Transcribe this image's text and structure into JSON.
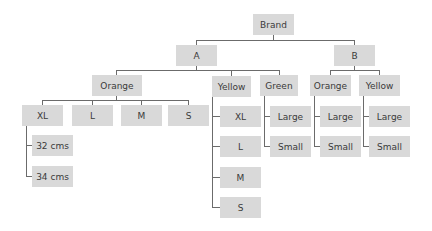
{
  "diagram": {
    "type": "tree",
    "node_fill": "#d9d9d9",
    "line_color": "#6b6b6b",
    "text_color": "#3a3a3a",
    "nodes": [
      {
        "id": "brand",
        "label": "Brand",
        "x": 253,
        "y": 14,
        "w": 41,
        "h": 21
      },
      {
        "id": "a",
        "label": "A",
        "x": 176,
        "y": 45,
        "w": 41,
        "h": 21
      },
      {
        "id": "b",
        "label": "B",
        "x": 334,
        "y": 45,
        "w": 41,
        "h": 21
      },
      {
        "id": "a-orange",
        "label": "Orange",
        "x": 92,
        "y": 75,
        "w": 50,
        "h": 21
      },
      {
        "id": "a-yellow",
        "label": "Yellow",
        "x": 212,
        "y": 76,
        "w": 39,
        "h": 21
      },
      {
        "id": "a-green",
        "label": "Green",
        "x": 260,
        "y": 75,
        "w": 38,
        "h": 21
      },
      {
        "id": "b-orange",
        "label": "Orange",
        "x": 310,
        "y": 75,
        "w": 41,
        "h": 21
      },
      {
        "id": "b-yellow",
        "label": "Yellow",
        "x": 359,
        "y": 75,
        "w": 41,
        "h": 21
      },
      {
        "id": "ao-xl",
        "label": "XL",
        "x": 22,
        "y": 105,
        "w": 41,
        "h": 21
      },
      {
        "id": "ao-l",
        "label": "L",
        "x": 72,
        "y": 105,
        "w": 41,
        "h": 21
      },
      {
        "id": "ao-m",
        "label": "M",
        "x": 121,
        "y": 105,
        "w": 41,
        "h": 21
      },
      {
        "id": "ao-s",
        "label": "S",
        "x": 168,
        "y": 105,
        "w": 41,
        "h": 21
      },
      {
        "id": "xl-32",
        "label": "32 cms",
        "x": 32,
        "y": 135,
        "w": 41,
        "h": 21
      },
      {
        "id": "xl-34",
        "label": "34 cms",
        "x": 32,
        "y": 166,
        "w": 41,
        "h": 21
      },
      {
        "id": "ay-xl",
        "label": "XL",
        "x": 220,
        "y": 106,
        "w": 41,
        "h": 21
      },
      {
        "id": "ay-l",
        "label": "L",
        "x": 220,
        "y": 136,
        "w": 41,
        "h": 21
      },
      {
        "id": "ay-m",
        "label": "M",
        "x": 220,
        "y": 167,
        "w": 41,
        "h": 21
      },
      {
        "id": "ay-s",
        "label": "S",
        "x": 220,
        "y": 197,
        "w": 41,
        "h": 21
      },
      {
        "id": "ag-large",
        "label": "Large",
        "x": 270,
        "y": 106,
        "w": 41,
        "h": 21
      },
      {
        "id": "ag-small",
        "label": "Small",
        "x": 270,
        "y": 136,
        "w": 41,
        "h": 21
      },
      {
        "id": "bo-large",
        "label": "Large",
        "x": 320,
        "y": 106,
        "w": 41,
        "h": 21
      },
      {
        "id": "bo-small",
        "label": "Small",
        "x": 320,
        "y": 136,
        "w": 41,
        "h": 21
      },
      {
        "id": "by-large",
        "label": "Large",
        "x": 369,
        "y": 106,
        "w": 41,
        "h": 21
      },
      {
        "id": "by-small",
        "label": "Small",
        "x": 369,
        "y": 136,
        "w": 41,
        "h": 21
      }
    ],
    "lines": [
      {
        "x": 273,
        "y": 35,
        "w": 1,
        "h": 5
      },
      {
        "x": 196,
        "y": 40,
        "w": 159,
        "h": 1
      },
      {
        "x": 196,
        "y": 40,
        "w": 1,
        "h": 5
      },
      {
        "x": 354,
        "y": 40,
        "w": 1,
        "h": 5
      },
      {
        "x": 196,
        "y": 66,
        "w": 1,
        "h": 4
      },
      {
        "x": 116,
        "y": 70,
        "w": 164,
        "h": 1
      },
      {
        "x": 116,
        "y": 70,
        "w": 1,
        "h": 5
      },
      {
        "x": 231,
        "y": 70,
        "w": 1,
        "h": 6
      },
      {
        "x": 279,
        "y": 70,
        "w": 1,
        "h": 5
      },
      {
        "x": 354,
        "y": 66,
        "w": 1,
        "h": 4
      },
      {
        "x": 330,
        "y": 70,
        "w": 50,
        "h": 1
      },
      {
        "x": 330,
        "y": 70,
        "w": 1,
        "h": 5
      },
      {
        "x": 379,
        "y": 70,
        "w": 1,
        "h": 5
      },
      {
        "x": 116,
        "y": 96,
        "w": 1,
        "h": 4
      },
      {
        "x": 42,
        "y": 100,
        "w": 147,
        "h": 1
      },
      {
        "x": 42,
        "y": 100,
        "w": 1,
        "h": 5
      },
      {
        "x": 92,
        "y": 100,
        "w": 1,
        "h": 5
      },
      {
        "x": 141,
        "y": 100,
        "w": 1,
        "h": 5
      },
      {
        "x": 188,
        "y": 100,
        "w": 1,
        "h": 5
      },
      {
        "x": 26,
        "y": 126,
        "w": 1,
        "h": 51
      },
      {
        "x": 26,
        "y": 145,
        "w": 6,
        "h": 1
      },
      {
        "x": 26,
        "y": 176,
        "w": 6,
        "h": 1
      },
      {
        "x": 212,
        "y": 97,
        "w": 1,
        "h": 111
      },
      {
        "x": 212,
        "y": 116,
        "w": 8,
        "h": 1
      },
      {
        "x": 212,
        "y": 146,
        "w": 8,
        "h": 1
      },
      {
        "x": 212,
        "y": 177,
        "w": 8,
        "h": 1
      },
      {
        "x": 212,
        "y": 207,
        "w": 8,
        "h": 1
      },
      {
        "x": 264,
        "y": 96,
        "w": 1,
        "h": 51
      },
      {
        "x": 264,
        "y": 116,
        "w": 6,
        "h": 1
      },
      {
        "x": 264,
        "y": 146,
        "w": 6,
        "h": 1
      },
      {
        "x": 314,
        "y": 96,
        "w": 1,
        "h": 51
      },
      {
        "x": 314,
        "y": 116,
        "w": 6,
        "h": 1
      },
      {
        "x": 314,
        "y": 146,
        "w": 6,
        "h": 1
      },
      {
        "x": 363,
        "y": 96,
        "w": 1,
        "h": 51
      },
      {
        "x": 363,
        "y": 116,
        "w": 6,
        "h": 1
      },
      {
        "x": 363,
        "y": 146,
        "w": 6,
        "h": 1
      }
    ]
  }
}
